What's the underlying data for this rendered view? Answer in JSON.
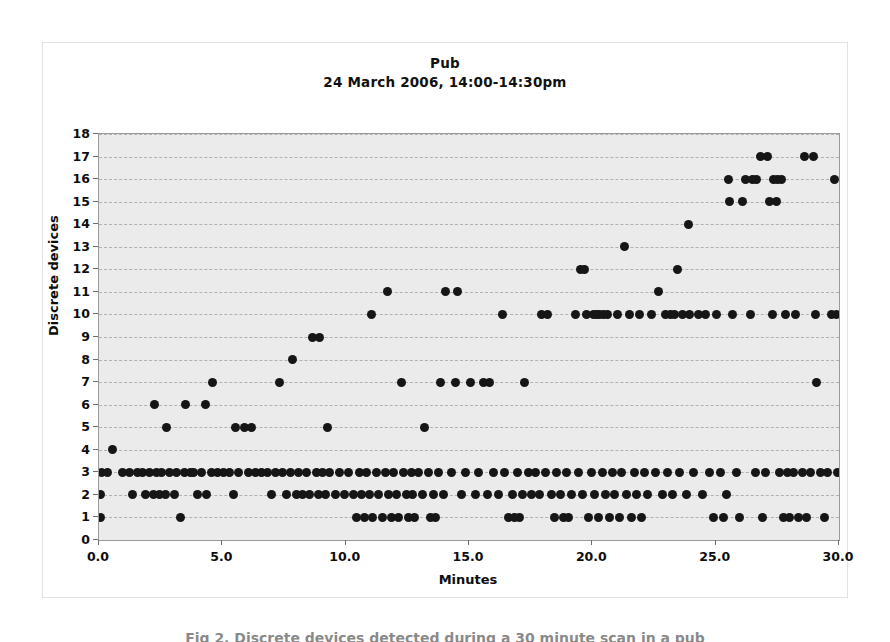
{
  "figure": {
    "caption": "Fig 2. Discrete devices detected during a 30 minute scan in a pub"
  },
  "chart_data": {
    "type": "scatter",
    "title": "Pub",
    "subtitle": "24 March 2006, 14:00-14:30pm",
    "xlabel": "Minutes",
    "ylabel": "Discrete devices",
    "xlim": [
      0.0,
      30.0
    ],
    "ylim": [
      0,
      18
    ],
    "xticks": [
      0.0,
      5.0,
      10.0,
      15.0,
      20.0,
      25.0,
      30.0
    ],
    "xtick_labels": [
      "0.0",
      "5.0",
      "10.0",
      "15.0",
      "20.0",
      "25.0",
      "30.0"
    ],
    "yticks": [
      0,
      1,
      2,
      3,
      4,
      5,
      6,
      7,
      8,
      9,
      10,
      11,
      12,
      13,
      14,
      15,
      16,
      17,
      18
    ],
    "ytick_labels": [
      "0",
      "1",
      "2",
      "3",
      "4",
      "5",
      "6",
      "7",
      "8",
      "9",
      "10",
      "11",
      "12",
      "13",
      "14",
      "15",
      "16",
      "17",
      "18"
    ],
    "grid": true,
    "grid_style": "dashed-horizontal",
    "legend": null,
    "marker": "filled-circle",
    "marker_color": "#161616",
    "plot_background": "#ebebeb",
    "points": [
      [
        0.05,
        1
      ],
      [
        0.05,
        2
      ],
      [
        0.1,
        3
      ],
      [
        0.35,
        3
      ],
      [
        0.55,
        4
      ],
      [
        0.95,
        3
      ],
      [
        1.25,
        3
      ],
      [
        1.35,
        2
      ],
      [
        1.55,
        3
      ],
      [
        1.75,
        3
      ],
      [
        1.9,
        2
      ],
      [
        2.05,
        3
      ],
      [
        2.2,
        2
      ],
      [
        2.25,
        6
      ],
      [
        2.35,
        3
      ],
      [
        2.45,
        2
      ],
      [
        2.55,
        3
      ],
      [
        2.7,
        2
      ],
      [
        2.75,
        5
      ],
      [
        2.85,
        3
      ],
      [
        3.05,
        2
      ],
      [
        3.15,
        3
      ],
      [
        3.3,
        1
      ],
      [
        3.45,
        3
      ],
      [
        3.5,
        6
      ],
      [
        3.7,
        3
      ],
      [
        3.85,
        3
      ],
      [
        4.0,
        2
      ],
      [
        4.15,
        3
      ],
      [
        4.3,
        6
      ],
      [
        4.35,
        2
      ],
      [
        4.55,
        3
      ],
      [
        4.6,
        7
      ],
      [
        4.8,
        3
      ],
      [
        5.05,
        3
      ],
      [
        5.3,
        3
      ],
      [
        5.45,
        2
      ],
      [
        5.55,
        5
      ],
      [
        5.65,
        3
      ],
      [
        5.9,
        5
      ],
      [
        6.05,
        3
      ],
      [
        6.2,
        5
      ],
      [
        6.35,
        3
      ],
      [
        6.6,
        3
      ],
      [
        6.85,
        3
      ],
      [
        7.0,
        2
      ],
      [
        7.15,
        3
      ],
      [
        7.3,
        7
      ],
      [
        7.45,
        3
      ],
      [
        7.6,
        2
      ],
      [
        7.75,
        3
      ],
      [
        7.85,
        8
      ],
      [
        8.0,
        2
      ],
      [
        8.1,
        3
      ],
      [
        8.25,
        2
      ],
      [
        8.4,
        3
      ],
      [
        8.55,
        2
      ],
      [
        8.65,
        9
      ],
      [
        8.8,
        3
      ],
      [
        8.9,
        2
      ],
      [
        8.95,
        9
      ],
      [
        9.05,
        3
      ],
      [
        9.2,
        2
      ],
      [
        9.25,
        5
      ],
      [
        9.35,
        3
      ],
      [
        9.6,
        2
      ],
      [
        9.75,
        3
      ],
      [
        9.95,
        2
      ],
      [
        10.1,
        3
      ],
      [
        10.3,
        2
      ],
      [
        10.45,
        1
      ],
      [
        10.55,
        3
      ],
      [
        10.65,
        2
      ],
      [
        10.75,
        1
      ],
      [
        10.85,
        3
      ],
      [
        10.95,
        2
      ],
      [
        11.05,
        10
      ],
      [
        11.1,
        1
      ],
      [
        11.25,
        3
      ],
      [
        11.35,
        2
      ],
      [
        11.5,
        1
      ],
      [
        11.6,
        3
      ],
      [
        11.7,
        11
      ],
      [
        11.75,
        2
      ],
      [
        11.85,
        1
      ],
      [
        11.95,
        3
      ],
      [
        12.05,
        2
      ],
      [
        12.15,
        1
      ],
      [
        12.25,
        7
      ],
      [
        12.35,
        3
      ],
      [
        12.45,
        2
      ],
      [
        12.55,
        1
      ],
      [
        12.65,
        3
      ],
      [
        12.7,
        2
      ],
      [
        12.8,
        1
      ],
      [
        12.95,
        3
      ],
      [
        13.1,
        2
      ],
      [
        13.2,
        5
      ],
      [
        13.35,
        3
      ],
      [
        13.45,
        1
      ],
      [
        13.55,
        2
      ],
      [
        13.65,
        1
      ],
      [
        13.75,
        3
      ],
      [
        13.85,
        7
      ],
      [
        13.95,
        2
      ],
      [
        14.05,
        11
      ],
      [
        14.3,
        3
      ],
      [
        14.45,
        7
      ],
      [
        14.55,
        11
      ],
      [
        14.7,
        2
      ],
      [
        14.85,
        3
      ],
      [
        15.05,
        7
      ],
      [
        15.25,
        2
      ],
      [
        15.4,
        3
      ],
      [
        15.6,
        7
      ],
      [
        15.75,
        2
      ],
      [
        15.85,
        7
      ],
      [
        16.0,
        3
      ],
      [
        16.2,
        2
      ],
      [
        16.35,
        10
      ],
      [
        16.45,
        3
      ],
      [
        16.6,
        1
      ],
      [
        16.75,
        2
      ],
      [
        16.85,
        1
      ],
      [
        16.95,
        3
      ],
      [
        17.05,
        1
      ],
      [
        17.15,
        2
      ],
      [
        17.25,
        7
      ],
      [
        17.4,
        3
      ],
      [
        17.55,
        2
      ],
      [
        17.7,
        3
      ],
      [
        17.85,
        2
      ],
      [
        17.95,
        10
      ],
      [
        18.1,
        3
      ],
      [
        18.2,
        10
      ],
      [
        18.35,
        2
      ],
      [
        18.45,
        1
      ],
      [
        18.55,
        3
      ],
      [
        18.7,
        2
      ],
      [
        18.85,
        1
      ],
      [
        18.95,
        3
      ],
      [
        19.05,
        1
      ],
      [
        19.15,
        2
      ],
      [
        19.3,
        10
      ],
      [
        19.45,
        3
      ],
      [
        19.5,
        12
      ],
      [
        19.6,
        2
      ],
      [
        19.7,
        12
      ],
      [
        19.75,
        10
      ],
      [
        19.85,
        1
      ],
      [
        19.95,
        3
      ],
      [
        20.05,
        10
      ],
      [
        20.1,
        2
      ],
      [
        20.15,
        10
      ],
      [
        20.25,
        1
      ],
      [
        20.3,
        10
      ],
      [
        20.4,
        3
      ],
      [
        20.45,
        10
      ],
      [
        20.55,
        2
      ],
      [
        20.6,
        10
      ],
      [
        20.7,
        1
      ],
      [
        20.8,
        3
      ],
      [
        20.9,
        2
      ],
      [
        21.0,
        10
      ],
      [
        21.1,
        1
      ],
      [
        21.2,
        3
      ],
      [
        21.3,
        13
      ],
      [
        21.4,
        2
      ],
      [
        21.5,
        10
      ],
      [
        21.6,
        1
      ],
      [
        21.7,
        3
      ],
      [
        21.8,
        2
      ],
      [
        21.9,
        10
      ],
      [
        22.0,
        1
      ],
      [
        22.1,
        3
      ],
      [
        22.25,
        2
      ],
      [
        22.4,
        10
      ],
      [
        22.55,
        3
      ],
      [
        22.7,
        11
      ],
      [
        22.85,
        2
      ],
      [
        22.95,
        10
      ],
      [
        23.05,
        3
      ],
      [
        23.15,
        10
      ],
      [
        23.25,
        2
      ],
      [
        23.35,
        10
      ],
      [
        23.45,
        12
      ],
      [
        23.55,
        3
      ],
      [
        23.65,
        10
      ],
      [
        23.8,
        2
      ],
      [
        23.9,
        14
      ],
      [
        23.95,
        10
      ],
      [
        24.1,
        3
      ],
      [
        24.3,
        10
      ],
      [
        24.45,
        2
      ],
      [
        24.6,
        10
      ],
      [
        24.75,
        3
      ],
      [
        24.9,
        1
      ],
      [
        25.05,
        10
      ],
      [
        25.2,
        3
      ],
      [
        25.3,
        1
      ],
      [
        25.45,
        2
      ],
      [
        25.5,
        16
      ],
      [
        25.55,
        15
      ],
      [
        25.7,
        10
      ],
      [
        25.85,
        3
      ],
      [
        25.95,
        1
      ],
      [
        26.1,
        15
      ],
      [
        26.2,
        16
      ],
      [
        26.4,
        10
      ],
      [
        26.5,
        16
      ],
      [
        26.6,
        3
      ],
      [
        26.65,
        16
      ],
      [
        26.8,
        17
      ],
      [
        26.9,
        1
      ],
      [
        27.0,
        3
      ],
      [
        27.1,
        17
      ],
      [
        27.2,
        15
      ],
      [
        27.3,
        10
      ],
      [
        27.35,
        16
      ],
      [
        27.45,
        15
      ],
      [
        27.5,
        16
      ],
      [
        27.6,
        3
      ],
      [
        27.65,
        16
      ],
      [
        27.75,
        1
      ],
      [
        27.85,
        10
      ],
      [
        27.9,
        3
      ],
      [
        28.0,
        1
      ],
      [
        28.15,
        3
      ],
      [
        28.25,
        10
      ],
      [
        28.35,
        1
      ],
      [
        28.5,
        3
      ],
      [
        28.6,
        17
      ],
      [
        28.7,
        1
      ],
      [
        28.85,
        3
      ],
      [
        28.95,
        17
      ],
      [
        29.05,
        10
      ],
      [
        29.1,
        7
      ],
      [
        29.25,
        3
      ],
      [
        29.4,
        1
      ],
      [
        29.55,
        3
      ],
      [
        29.7,
        10
      ],
      [
        29.8,
        16
      ],
      [
        29.9,
        10
      ],
      [
        29.95,
        3
      ]
    ]
  }
}
